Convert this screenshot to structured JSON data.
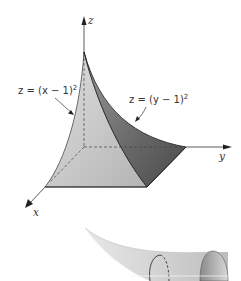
{
  "figure": {
    "axes": {
      "z_label": "z",
      "y_label": "y",
      "x_label": "x"
    },
    "surfaces": [
      {
        "name": "surface-x",
        "equation": "z = (x − 1)",
        "exponent": "2"
      },
      {
        "name": "surface-y",
        "equation": "z = (y − 1)",
        "exponent": "2"
      }
    ],
    "colors": {
      "light_face": "#c8c8c8",
      "dark_face": "#6e6e6e",
      "base_face": "#d6d6d6",
      "outline": "#222222",
      "horn": "#d0d0d0"
    }
  }
}
